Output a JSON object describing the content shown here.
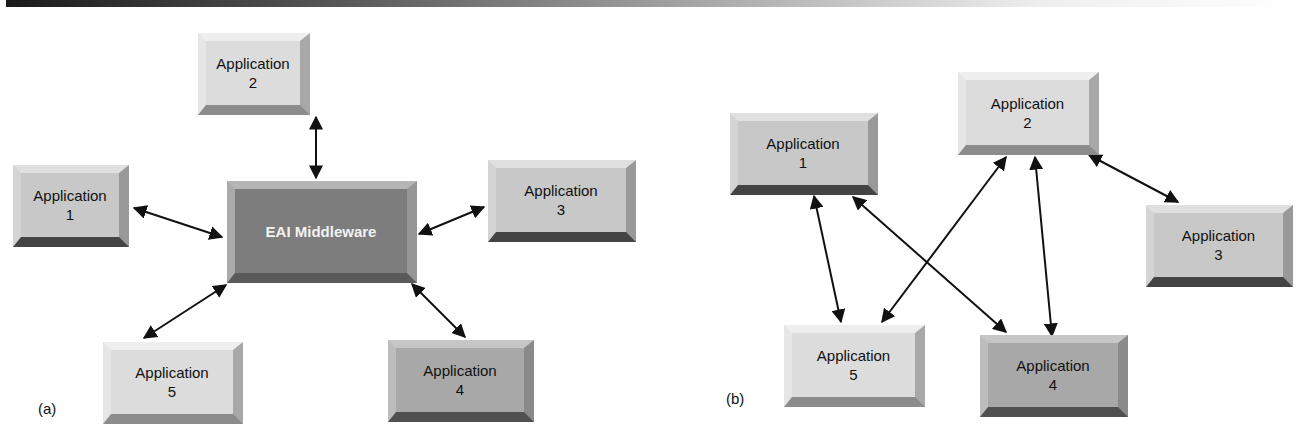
{
  "figure": {
    "panel_a": {
      "label": "(a)",
      "hub": {
        "name": "EAI Middleware"
      },
      "nodes": [
        {
          "id": "app1",
          "line1": "Application",
          "line2": "1"
        },
        {
          "id": "app2",
          "line1": "Application",
          "line2": "2"
        },
        {
          "id": "app3",
          "line1": "Application",
          "line2": "3"
        },
        {
          "id": "app4",
          "line1": "Application",
          "line2": "4"
        },
        {
          "id": "app5",
          "line1": "Application",
          "line2": "5"
        }
      ],
      "edges": [
        [
          "hub",
          "app1"
        ],
        [
          "hub",
          "app2"
        ],
        [
          "hub",
          "app3"
        ],
        [
          "hub",
          "app4"
        ],
        [
          "hub",
          "app5"
        ]
      ],
      "edge_style": "bidirectional"
    },
    "panel_b": {
      "label": "(b)",
      "nodes": [
        {
          "id": "app1",
          "line1": "Application",
          "line2": "1"
        },
        {
          "id": "app2",
          "line1": "Application",
          "line2": "2"
        },
        {
          "id": "app3",
          "line1": "Application",
          "line2": "3"
        },
        {
          "id": "app4",
          "line1": "Application",
          "line2": "4"
        },
        {
          "id": "app5",
          "line1": "Application",
          "line2": "5"
        }
      ],
      "edges": [
        [
          "app1",
          "app5"
        ],
        [
          "app1",
          "app4"
        ],
        [
          "app2",
          "app5"
        ],
        [
          "app2",
          "app4"
        ],
        [
          "app2",
          "app3"
        ]
      ],
      "edge_style": "bidirectional"
    },
    "colors": {
      "light_box": "#dcdcdc",
      "mid_box": "#c8c8c8",
      "dark_box": "#a8a8a8",
      "hub_box": "#7d7d7d",
      "arrow": "#111111"
    }
  }
}
